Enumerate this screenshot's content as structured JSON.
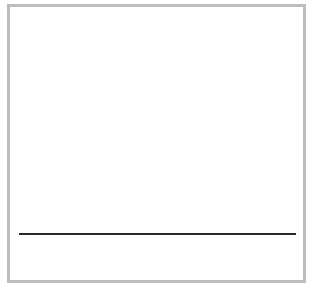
{
  "canvas": {
    "border_color": "#bdbdbd",
    "background_color": "#ffffff",
    "line_color": "#2a2a2a"
  }
}
